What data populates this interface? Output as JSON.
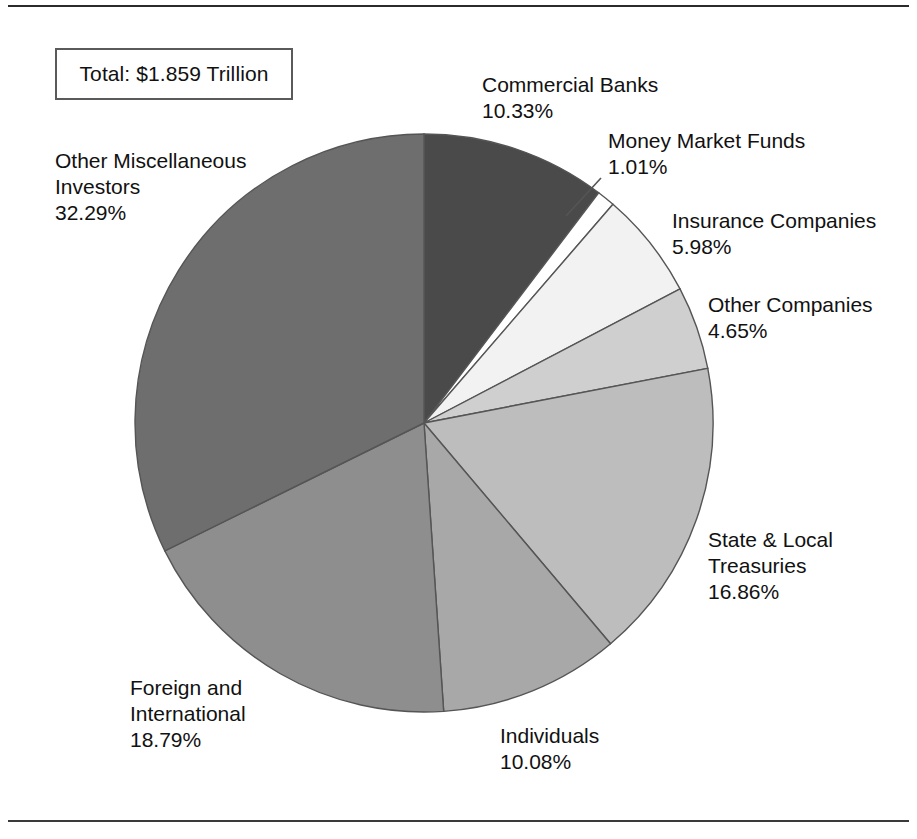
{
  "figure": {
    "total_box_label": "Total:  $1.859 Trillion",
    "has_top_rule": true,
    "has_bottom_rule": true
  },
  "labels": {
    "commercial_banks": {
      "name": "Commercial Banks",
      "pct": "10.33%"
    },
    "money_market_funds": {
      "name": "Money Market Funds",
      "pct": "1.01%"
    },
    "insurance_companies": {
      "name": "Insurance Companies",
      "pct": "5.98%"
    },
    "other_companies": {
      "name": "Other Companies",
      "pct": "4.65%"
    },
    "state_local_treasuries": {
      "name_line1": "State & Local",
      "name_line2": "Treasuries",
      "pct": "16.86%"
    },
    "individuals": {
      "name": "Individuals",
      "pct": "10.08%"
    },
    "foreign_international": {
      "name_line1": "Foreign and",
      "name_line2": "International",
      "pct": "18.79%"
    },
    "other_miscellaneous": {
      "name_line1": "Other Miscellaneous",
      "name_line2": "Investors",
      "pct": "32.29%"
    }
  },
  "chart_data": {
    "type": "pie",
    "title": "Total:  $1.859 Trillion",
    "units": "percent of total",
    "total_label": "$1.859 Trillion",
    "start_angle_deg": 0,
    "direction": "clockwise",
    "legend": "none (direct labels)",
    "grid": false,
    "categories": [
      "Commercial Banks",
      "Money Market Funds",
      "Insurance Companies",
      "Other Companies",
      "State & Local Treasuries",
      "Individuals",
      "Foreign and International",
      "Other Miscellaneous Investors"
    ],
    "values": [
      10.33,
      1.01,
      5.98,
      4.65,
      16.86,
      10.08,
      18.79,
      32.29
    ],
    "value_labels": [
      "10.33%",
      "1.01%",
      "5.98%",
      "4.65%",
      "16.86%",
      "10.08%",
      "18.79%",
      "32.29%"
    ],
    "colors": [
      "#4a4a4a",
      "#ffffff",
      "#f2f2f2",
      "#cfcfcf",
      "#bdbdbd",
      "#a8a8a8",
      "#8e8e8e",
      "#6e6e6e"
    ],
    "slice_stroke": "#555555",
    "geometry": {
      "cx": 424,
      "cy": 423,
      "r": 289
    }
  }
}
